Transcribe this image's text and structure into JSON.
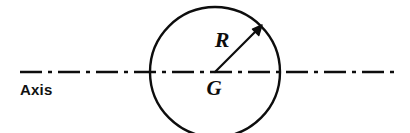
{
  "figure": {
    "name": "sphere-radius-on-axis-diagram",
    "background_color": "#ffffff",
    "stroke_color": "#0d0d0d",
    "width": 410,
    "height": 133
  },
  "axis": {
    "label": "Axis",
    "label_x": 20,
    "label_y": 95,
    "line_y": 72,
    "line_start_x": 20,
    "line_end_x": 396,
    "style": "dash-dot",
    "dash_pattern": "22 6 4 6",
    "stroke_width": 2.4
  },
  "circle": {
    "name": "circle",
    "center_x": 215,
    "center_y": 72,
    "radius": 65,
    "stroke_width": 2.4,
    "fill": "none"
  },
  "radius_arrow": {
    "name": "radius-arrow",
    "label": "R",
    "label_x": 222,
    "label_y": 47,
    "from_x": 215,
    "from_y": 72,
    "to_x": 261,
    "to_y": 26,
    "angle_degrees": 45,
    "stroke_width": 2.2
  },
  "center_point": {
    "name": "center-point",
    "label": "G",
    "label_x": 214,
    "label_y": 95
  }
}
